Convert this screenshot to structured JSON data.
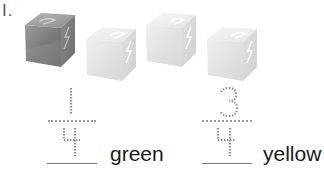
{
  "problem": {
    "number_label": "I."
  },
  "cubes": [
    {
      "color_name": "green",
      "shade": "dark",
      "fill": "#8a8a8a"
    },
    {
      "color_name": "yellow",
      "shade": "light",
      "fill": "#e6e6e6"
    },
    {
      "color_name": "yellow",
      "shade": "light",
      "fill": "#e6e6e6"
    },
    {
      "color_name": "yellow",
      "shade": "light",
      "fill": "#e6e6e6"
    }
  ],
  "fractions": [
    {
      "numerator": "1",
      "denominator": "4",
      "answer": "",
      "label": "green"
    },
    {
      "numerator": "3",
      "denominator": "4",
      "answer": "",
      "label": "yellow"
    }
  ]
}
